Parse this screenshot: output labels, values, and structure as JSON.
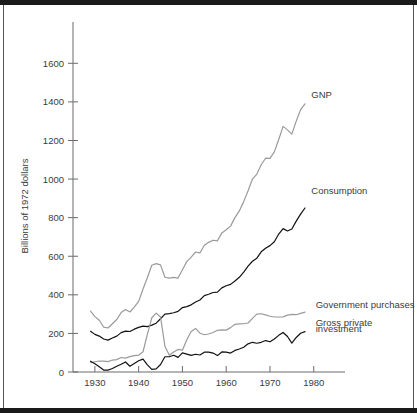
{
  "chart_data": {
    "type": "line",
    "title": "",
    "xlabel": "",
    "ylabel": "Billions of 1972 dollars",
    "xlim": [
      1925,
      1986
    ],
    "ylim": [
      0,
      1700
    ],
    "grid": false,
    "legend_position": "inline-annotations",
    "xticks": [
      1930,
      1940,
      1950,
      1960,
      1970,
      1980
    ],
    "xtick_labels": [
      "1930",
      "1940",
      "1950",
      "1960",
      "1970",
      "1980"
    ],
    "yticks": [
      0,
      200,
      400,
      600,
      800,
      1000,
      1200,
      1400,
      1600
    ],
    "ytick_labels": [
      "0",
      "200",
      "400",
      "600",
      "800",
      "1000",
      "1200",
      "1400",
      "1600"
    ],
    "x": [
      1929,
      1930,
      1931,
      1932,
      1933,
      1934,
      1935,
      1936,
      1937,
      1938,
      1939,
      1940,
      1941,
      1942,
      1943,
      1944,
      1945,
      1946,
      1947,
      1948,
      1949,
      1950,
      1951,
      1952,
      1953,
      1954,
      1955,
      1956,
      1957,
      1958,
      1959,
      1960,
      1961,
      1962,
      1963,
      1964,
      1965,
      1966,
      1967,
      1968,
      1969,
      1970,
      1971,
      1972,
      1973,
      1974,
      1975,
      1976,
      1977,
      1978
    ],
    "series": [
      {
        "name": "GNP",
        "color": "#6a6a6a",
        "label": "GNP",
        "values": [
          315,
          287,
          268,
          233,
          228,
          250,
          272,
          308,
          324,
          311,
          336,
          366,
          430,
          490,
          553,
          562,
          555,
          491,
          487,
          490,
          487,
          530,
          572,
          595,
          622,
          617,
          657,
          672,
          683,
          680,
          721,
          737,
          756,
          800,
          835,
          883,
          939,
          1000,
          1026,
          1074,
          1108,
          1107,
          1141,
          1205,
          1273,
          1255,
          1233,
          1300,
          1360,
          1390
        ]
      },
      {
        "name": "Consumption",
        "color": "#111111",
        "label": "Consumption",
        "values": [
          211,
          195,
          186,
          171,
          165,
          176,
          186,
          204,
          212,
          210,
          222,
          231,
          238,
          235,
          243,
          253,
          276,
          300,
          303,
          307,
          314,
          334,
          339,
          348,
          363,
          373,
          396,
          403,
          412,
          414,
          436,
          447,
          454,
          472,
          491,
          518,
          549,
          574,
          590,
          623,
          641,
          655,
          675,
          715,
          743,
          731,
          741,
          782,
          818,
          850
        ]
      },
      {
        "name": "Government purchases",
        "color": "#9a9a9a",
        "label": "Government purchases",
        "values": [
          48,
          53,
          57,
          56,
          54,
          62,
          64,
          75,
          72,
          80,
          85,
          87,
          105,
          196,
          281,
          305,
          285,
          134,
          87,
          104,
          117,
          113,
          167,
          210,
          226,
          201,
          193,
          197,
          205,
          216,
          218,
          217,
          230,
          247,
          249,
          250,
          254,
          278,
          300,
          302,
          296,
          289,
          285,
          285,
          286,
          295,
          299,
          297,
          304,
          310
        ]
      },
      {
        "name": "Gross private investment",
        "color": "#111111",
        "label": "Gross private investment",
        "label_line2": "investment",
        "values": [
          56,
          43,
          27,
          10,
          10,
          18,
          30,
          40,
          52,
          30,
          44,
          58,
          67,
          37,
          14,
          16,
          39,
          79,
          79,
          87,
          76,
          99,
          93,
          86,
          92,
          88,
          103,
          103,
          98,
          85,
          104,
          103,
          98,
          112,
          119,
          128,
          146,
          154,
          149,
          154,
          163,
          157,
          171,
          190,
          205,
          184,
          150,
          179,
          201,
          209
        ]
      }
    ],
    "annotations": [
      {
        "text": "GNP",
        "x": 1979,
        "y": 1420
      },
      {
        "text": "Consumption",
        "x": 1979,
        "y": 920
      },
      {
        "text": "Government purchases",
        "x": 1980,
        "y": 330
      },
      {
        "text": "Gross private",
        "x": 1980,
        "y": 240
      },
      {
        "text": "investment",
        "x": 1980,
        "y": 205
      }
    ]
  }
}
